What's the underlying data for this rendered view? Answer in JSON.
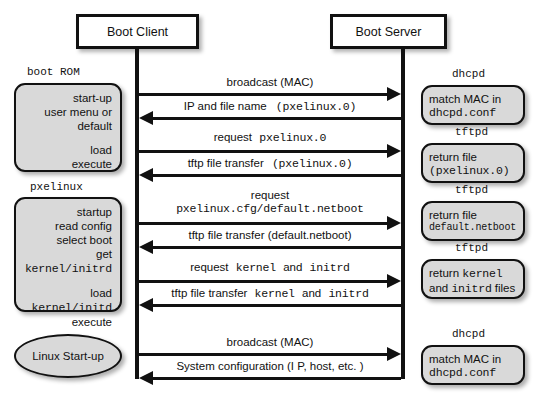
{
  "diagram": {
    "actors": {
      "client": "Boot Client",
      "server": "Boot Server"
    },
    "client_states": [
      {
        "label": "boot ROM",
        "lines": [
          "start-up",
          "user menu or",
          "default",
          "",
          "load",
          "execute"
        ]
      },
      {
        "label": "pxelinux",
        "lines": [
          "startup",
          "read config",
          "select boot",
          "get kernel/initrd",
          "",
          "load kernel/initd",
          "execute"
        ]
      },
      {
        "label": "",
        "lines": [
          "Linux Start-up"
        ]
      }
    ],
    "client_state_text": {
      "bootrom_label": "boot ROM",
      "bootrom_l1": "start-up",
      "bootrom_l2": "user menu or",
      "bootrom_l3": "default",
      "bootrom_l4": "load",
      "bootrom_l5": "execute",
      "pxelinux_label": "pxelinux",
      "pxelinux_l1": "startup",
      "pxelinux_l2": "read config",
      "pxelinux_l3": "select boot",
      "pxelinux_l4_prefix": "get ",
      "pxelinux_l4_mono": "kernel/initrd",
      "pxelinux_l5_prefix": "load ",
      "pxelinux_l5_mono": "kernel/initd",
      "pxelinux_l6": "execute",
      "linux_startup": "Linux Start-up"
    },
    "server_states": [
      {
        "label": "dhcpd",
        "line1": "match MAC in",
        "line2_mono": "dhcpd.conf"
      },
      {
        "label": "tftpd",
        "line1": "return file",
        "line2_mono": "(pxelinux.0)"
      },
      {
        "label": "tftpd",
        "line1": "return file",
        "line2_mono": "default.netboot"
      },
      {
        "label": "tftpd",
        "line1_prefix": "return ",
        "line1_mono": "kernel",
        "line2_prefix": "and ",
        "line2_mono": "initrd",
        "line2_suffix": " files"
      },
      {
        "label": "dhcpd",
        "line1": "match MAC in",
        "line2_mono": "dhcpd.conf"
      }
    ],
    "messages": [
      {
        "direction": "right",
        "text": "broadcast (MAC)"
      },
      {
        "direction": "left",
        "text_plain": "IP and file name",
        "text_mono": "(pxelinux.0)"
      },
      {
        "direction": "right",
        "text_plain": "request",
        "text_mono": "pxelinux.0"
      },
      {
        "direction": "left",
        "text_plain": "tftp file transfer",
        "text_mono": "(pxelinux.0)"
      },
      {
        "direction": "right",
        "line1": "request",
        "line2_mono": "pxelinux.cfg/default.netboot"
      },
      {
        "direction": "left",
        "text": "tftp file transfer (default.netboot)"
      },
      {
        "direction": "right",
        "text_plain": "request",
        "text_mono": "kernel",
        "text_plain2": "and",
        "text_mono2": "initrd"
      },
      {
        "direction": "left",
        "text_plain": "tftp file transfer",
        "text_mono": "kernel",
        "text_plain2": "and",
        "text_mono2": "initrd"
      },
      {
        "direction": "right",
        "text": "broadcast (MAC)"
      },
      {
        "direction": "left",
        "text": "System configuration (I P, host, etc. )"
      }
    ],
    "msg_text": {
      "m1": "broadcast (MAC)",
      "m2_a": "IP and file name",
      "m2_b": "(pxelinux.0)",
      "m3_a": "request",
      "m3_b": "pxelinux.0",
      "m4_a": "tftp file transfer",
      "m4_b": "(pxelinux.0)",
      "m5_a": "request",
      "m5_b": "pxelinux.cfg/default.netboot",
      "m6": "tftp file transfer (default.netboot)",
      "m7_a": "request",
      "m7_b": "kernel",
      "m7_c": "and",
      "m7_d": "initrd",
      "m8_a": "tftp file transfer",
      "m8_b": "kernel",
      "m8_c": "and",
      "m8_d": "initrd",
      "m9": "broadcast (MAC)",
      "m10": "System configuration (I P, host, etc. )"
    },
    "colors": {
      "stroke": "#111111",
      "box_fill": "#d9d9d9",
      "actor_fill": "#ffffff",
      "background": "#ffffff"
    }
  }
}
